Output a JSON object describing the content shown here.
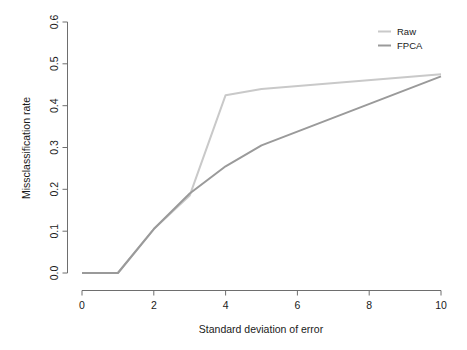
{
  "chart_data": {
    "type": "line",
    "title": "",
    "xlabel": "Standard deviation of error",
    "ylabel": "Missclassification rate",
    "x": [
      0,
      1,
      2,
      3,
      4,
      5,
      10
    ],
    "series": [
      {
        "name": "Raw",
        "color": "#c9c9c9",
        "values": [
          0.0,
          0.0,
          0.105,
          0.185,
          0.425,
          0.44,
          0.475
        ]
      },
      {
        "name": "FPCA",
        "color": "#9a9a9a",
        "values": [
          0.0,
          0.0,
          0.105,
          0.19,
          0.255,
          0.305,
          0.47
        ]
      }
    ],
    "xlim": [
      0,
      10
    ],
    "ylim": [
      0.0,
      0.6
    ],
    "xticks": [
      0,
      2,
      4,
      6,
      8,
      10
    ],
    "xtick_labels": [
      "0",
      "2",
      "4",
      "6",
      "8",
      "10"
    ],
    "yticks": [
      0.0,
      0.1,
      0.2,
      0.3,
      0.4,
      0.5,
      0.6
    ],
    "ytick_labels": [
      "0.0",
      "0.1",
      "0.2",
      "0.3",
      "0.4",
      "0.5",
      "0.6"
    ],
    "grid": false,
    "legend_position": "top-right",
    "legend": [
      "Raw",
      "FPCA"
    ],
    "background_color": "#ffffff",
    "axis_color": "#6e6e6e"
  },
  "figure": {
    "ylabel": "Missclassification rate",
    "xlabel": "Standard deviation of error",
    "legend": {
      "raw_label": "Raw",
      "fpca_label": "FPCA"
    },
    "xtick_labels": [
      "0",
      "2",
      "4",
      "6",
      "8",
      "10"
    ],
    "ytick_labels": [
      "0.0",
      "0.1",
      "0.2",
      "0.3",
      "0.4",
      "0.5",
      "0.6"
    ],
    "caption_fragment": ""
  }
}
